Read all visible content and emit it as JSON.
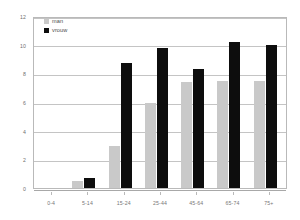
{
  "chart_data": {
    "type": "bar",
    "title": "",
    "xlabel": "",
    "ylabel": "",
    "categories": [
      "0-4",
      "5-14",
      "15-24",
      "25-44",
      "45-64",
      "65-74",
      "75+"
    ],
    "series": [
      {
        "name": "man",
        "color": "#c9c9c9",
        "values": [
          0,
          0.5,
          2.9,
          5.9,
          7.4,
          7.5,
          7.45
        ]
      },
      {
        "name": "vrouw",
        "color": "#0d0d0d",
        "values": [
          0,
          0.7,
          8.7,
          9.8,
          8.3,
          10.2,
          10.0
        ]
      }
    ],
    "ylim": [
      0,
      12
    ],
    "y_ticks": [
      0,
      2,
      4,
      6,
      8,
      10,
      12
    ],
    "y_tick_labels": [
      "0",
      "2",
      "4",
      "6",
      "8",
      "10",
      "12"
    ],
    "grid": "horizontal",
    "legend_position": "top-left"
  },
  "legend": {
    "entries": [
      {
        "label": "man"
      },
      {
        "label": "vrouw"
      }
    ]
  }
}
